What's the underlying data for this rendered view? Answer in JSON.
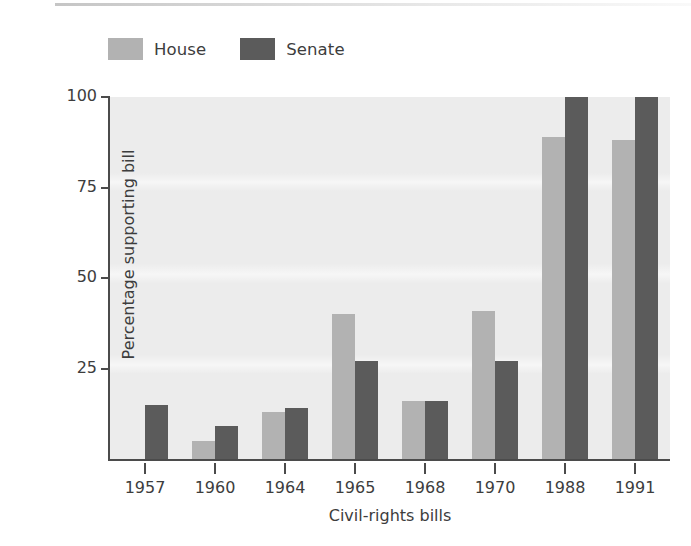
{
  "chart_data": {
    "type": "bar",
    "title": "",
    "xlabel": "Civil-rights bills",
    "ylabel": "Percentage supporting bill",
    "categories": [
      "1957",
      "1960",
      "1964",
      "1965",
      "1968",
      "1970",
      "1988",
      "1991"
    ],
    "ylim": [
      0,
      100
    ],
    "yticks": [
      25,
      50,
      75,
      100
    ],
    "ytick_labels": [
      "25",
      "50",
      "75",
      "100"
    ],
    "grid": false,
    "legend_position": "above-plot-left",
    "series": [
      {
        "name": "House",
        "color": "#b2b2b2",
        "values": [
          null,
          5,
          13,
          40,
          16,
          41,
          89,
          88
        ]
      },
      {
        "name": "Senate",
        "color": "#5b5b5b",
        "values": [
          15,
          9,
          14,
          27,
          16,
          27,
          100,
          100
        ]
      }
    ]
  },
  "legend": {
    "entries": [
      {
        "label": "House",
        "swatch_name": "house-swatch"
      },
      {
        "label": "Senate",
        "swatch_name": "senate-swatch"
      }
    ]
  },
  "colors": {
    "house": "#b2b2b2",
    "senate": "#5b5b5b",
    "plot_background": "#ececec",
    "axis": "#4b4b4b",
    "text": "#3d3d3d",
    "page_background": "#ffffff"
  }
}
